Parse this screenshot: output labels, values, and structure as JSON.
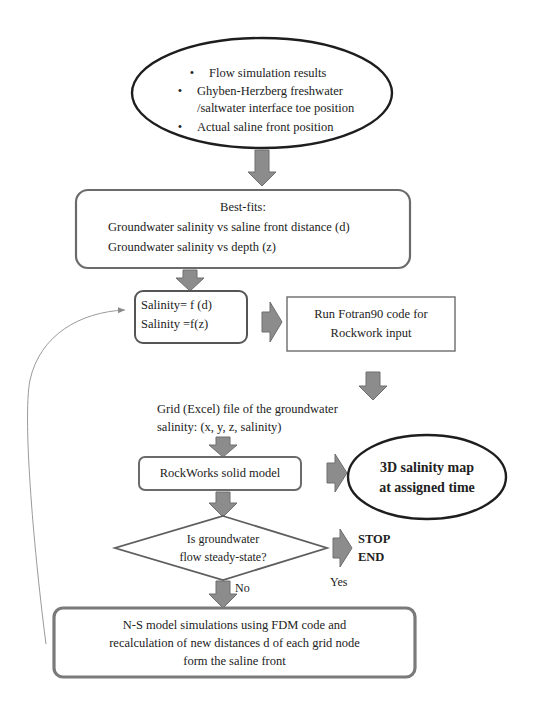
{
  "colors": {
    "stroke": "#222222",
    "box_stroke": "#6b6b6b",
    "arrow_fill": "#8c8c8c",
    "arrow_stroke": "#6e6e6e",
    "loop_line": "#9a9a9a",
    "background": "#ffffff"
  },
  "inputs_ellipse": {
    "items": [
      {
        "bullet": "•",
        "lines": [
          "Flow simulation results"
        ]
      },
      {
        "bullet": "•",
        "lines": [
          "Ghyben-Herzberg freshwater",
          "/saltwater interface toe position"
        ]
      },
      {
        "bullet": "•",
        "lines": [
          "Actual saline front position"
        ]
      }
    ]
  },
  "best_fits": {
    "title": "Best-fits:",
    "line1": "Groundwater salinity vs saline front distance (d)",
    "line2": "Groundwater salinity vs depth (z)"
  },
  "salinity_functions": {
    "line1": "Salinity= f (d)",
    "line2": "Salinity =f(z)"
  },
  "fortran_box": {
    "line1": "Run Fotran90 code for",
    "line2": "Rockwork input"
  },
  "grid_file": {
    "line1": "Grid (Excel) file of the groundwater",
    "line2": "salinity: (x, y, z, salinity)"
  },
  "rockworks_box": {
    "label": "RockWorks solid model"
  },
  "output_ellipse": {
    "line1": "3D salinity map",
    "line2": "at assigned time"
  },
  "decision": {
    "line1": "Is groundwater",
    "line2": "flow steady-state?",
    "yes_label": "Yes",
    "no_label": "No"
  },
  "terminal": {
    "line1": "STOP",
    "line2": "END"
  },
  "ns_box": {
    "line1": "N-S model simulations using FDM code and",
    "line2": "recalculation of new distances d of each grid node",
    "line3": "form the saline front"
  }
}
